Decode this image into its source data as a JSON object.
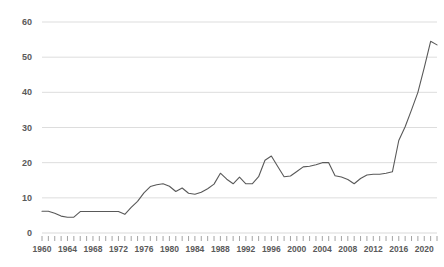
{
  "chart_data": {
    "type": "line",
    "title": "",
    "subtitle": "",
    "xlabel": "",
    "ylabel": "",
    "xlim": [
      1960,
      2022
    ],
    "ylim": [
      0,
      60
    ],
    "grid": true,
    "grid_axis": "y",
    "legend": false,
    "legend_position": "none",
    "line_color": "#595959",
    "grid_color": "#d9d9d9",
    "text_color": "#595959",
    "background": "#ffffff",
    "y_ticks": [
      0,
      10,
      20,
      30,
      40,
      50,
      60
    ],
    "y_tick_labels": [
      "0",
      "10",
      "20",
      "30",
      "40",
      "50",
      "60"
    ],
    "x_tick_labels": [
      "1960",
      "1964",
      "1968",
      "1972",
      "1976",
      "1980",
      "1984",
      "1988",
      "1992",
      "1996",
      "2000",
      "2004",
      "2008",
      "2012",
      "2016",
      "2020"
    ],
    "x_tick_label_values": [
      1960,
      1964,
      1968,
      1972,
      1976,
      1980,
      1984,
      1988,
      1992,
      1996,
      2000,
      2004,
      2008,
      2012,
      2016,
      2020
    ],
    "x_minor_tick_interval": 1,
    "x": [
      1960,
      1961,
      1962,
      1963,
      1964,
      1965,
      1966,
      1967,
      1968,
      1969,
      1970,
      1971,
      1972,
      1973,
      1974,
      1975,
      1976,
      1977,
      1978,
      1979,
      1980,
      1981,
      1982,
      1983,
      1984,
      1985,
      1986,
      1987,
      1988,
      1989,
      1990,
      1991,
      1992,
      1993,
      1994,
      1995,
      1996,
      1997,
      1998,
      1999,
      2000,
      2001,
      2002,
      2003,
      2004,
      2005,
      2006,
      2007,
      2008,
      2009,
      2010,
      2011,
      2012,
      2013,
      2014,
      2015,
      2016,
      2017,
      2018,
      2019,
      2020,
      2021,
      2022
    ],
    "values": [
      6.2,
      6.2,
      5.6,
      4.8,
      4.5,
      4.5,
      6.1,
      6.1,
      6.1,
      6.1,
      6.1,
      6.1,
      6.1,
      5.3,
      7.3,
      9.0,
      11.4,
      13.2,
      13.7,
      14.0,
      13.3,
      11.8,
      12.8,
      11.3,
      11.0,
      11.6,
      12.6,
      13.9,
      17.0,
      15.3,
      14.0,
      15.9,
      14.0,
      14.0,
      16.0,
      20.7,
      21.9,
      18.9,
      16.0,
      16.2,
      17.5,
      18.8,
      19.0,
      19.4,
      20.0,
      20.0,
      16.3,
      15.9,
      15.2,
      14.0,
      15.5,
      16.5,
      16.7,
      16.7,
      17.0,
      17.4,
      26.3,
      30.2,
      32.0,
      32.6,
      31.0,
      28.8,
      31.8
    ],
    "values_note": "Series continues: see series_tail",
    "series_tail_x": [
      2018,
      2019,
      2020,
      2021,
      2022
    ],
    "series_tail_values": [
      35.0,
      40.0,
      47.0,
      54.5,
      53.5
    ]
  },
  "axes": {
    "y_axis_name": "value-axis",
    "x_axis_name": "year-axis"
  }
}
